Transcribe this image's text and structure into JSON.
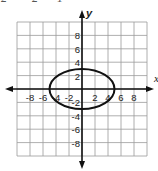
{
  "header": {
    "equation_fragment": [
      "2",
      "2",
      "1"
    ]
  },
  "graph": {
    "x_axis_label": "x",
    "y_axis_label": "y",
    "x_range": [
      -10,
      10
    ],
    "y_range": [
      -10,
      10
    ],
    "grid_step": 2,
    "x_tick_labels": [
      "-8",
      "-6",
      "-4",
      "-2",
      "2",
      "4",
      "6",
      "8"
    ],
    "y_tick_labels": [
      "8",
      "6",
      "4",
      "2",
      "-2",
      "-4",
      "-6",
      "-8"
    ],
    "ellipse": {
      "center": [
        0,
        0
      ],
      "semi_major_x": 5,
      "semi_minor_y": 3
    },
    "colors": {
      "grid": "#9a9a9a",
      "axis": "#111111",
      "curve": "#111111",
      "text": "#222222"
    }
  }
}
